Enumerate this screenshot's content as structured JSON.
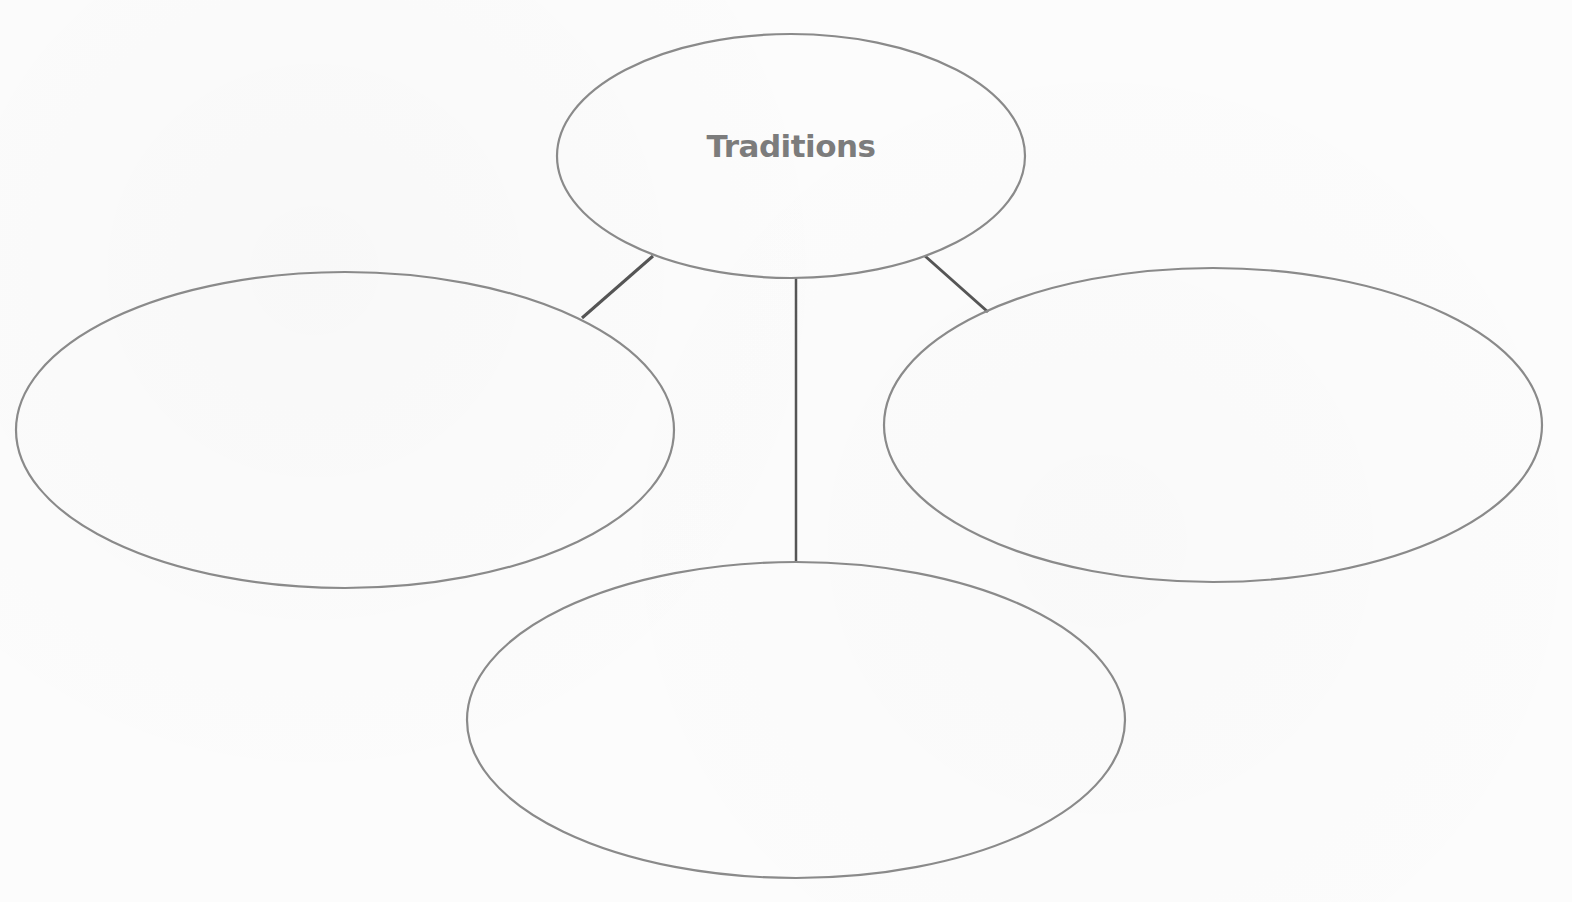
{
  "diagram": {
    "type": "web-organizer",
    "center_node": {
      "label": "Traditions",
      "cx": 791,
      "cy": 156,
      "rx": 234,
      "ry": 122
    },
    "branch_nodes": [
      {
        "id": "left",
        "label": "",
        "cx": 345,
        "cy": 430,
        "rx": 329,
        "ry": 158
      },
      {
        "id": "right",
        "label": "",
        "cx": 1213,
        "cy": 425,
        "rx": 329,
        "ry": 157
      },
      {
        "id": "bottom",
        "label": "",
        "cx": 796,
        "cy": 720,
        "rx": 329,
        "ry": 158
      }
    ],
    "connectors": [
      {
        "from": "center",
        "to": "left",
        "x1": 653,
        "y1": 256,
        "x2": 582,
        "y2": 318
      },
      {
        "from": "center",
        "to": "bottom",
        "x1": 796,
        "y1": 278,
        "x2": 796,
        "y2": 562
      },
      {
        "from": "center",
        "to": "right",
        "x1": 925,
        "y1": 256,
        "x2": 988,
        "y2": 312
      }
    ],
    "colors": {
      "outline": "#8a8a8a",
      "connector": "#555555",
      "label": "#7c7c7c",
      "background": "#fcfcfc"
    }
  }
}
